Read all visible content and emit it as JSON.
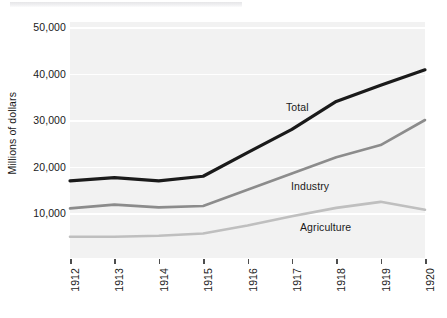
{
  "figure": {
    "kind": "statistical-line-chart",
    "background_color": "#ffffff",
    "panel_color": "#f2f2f2",
    "gridline_color": "#ffffff"
  },
  "chart_data": {
    "type": "line",
    "title": "",
    "xlabel": "",
    "ylabel": "Millions of dollars",
    "x": [
      "1912",
      "1913",
      "1914",
      "1915",
      "1916",
      "1917",
      "1918",
      "1919",
      "1920"
    ],
    "xtick_labels": [
      "1912",
      "1913",
      "1914",
      "1915",
      "1916",
      "1917",
      "1918",
      "1919",
      "1920"
    ],
    "ytick_labels": [
      "50,000",
      "40,000",
      "30,000",
      "20,000",
      "10,000"
    ],
    "ytick_values": [
      50000,
      40000,
      30000,
      20000,
      10000
    ],
    "ylim": [
      0,
      52000
    ],
    "grid": true,
    "grid_axis": "y",
    "legend": "inline-annotations",
    "series": [
      {
        "name": "Total",
        "color": "#1a1a1a",
        "linewidth": 3.2,
        "label_text": "Total",
        "values": [
          16900,
          17600,
          16900,
          17900,
          23000,
          28000,
          34000,
          37500,
          40800
        ]
      },
      {
        "name": "Industry",
        "color": "#8c8c8c",
        "linewidth": 2.6,
        "label_text": "Industry",
        "values": [
          11000,
          11800,
          11200,
          11500,
          15000,
          18500,
          22000,
          24600,
          30000
        ]
      },
      {
        "name": "Agriculture",
        "color": "#bfbfbf",
        "linewidth": 2.6,
        "label_text": "Agriculture",
        "values": [
          4900,
          4900,
          5100,
          5600,
          7300,
          9300,
          11100,
          12400,
          10700
        ]
      }
    ],
    "annotations": [
      {
        "text": "Total",
        "series": "Total"
      },
      {
        "text": "Industry",
        "series": "Industry"
      },
      {
        "text": "Agriculture",
        "series": "Agriculture"
      }
    ]
  }
}
